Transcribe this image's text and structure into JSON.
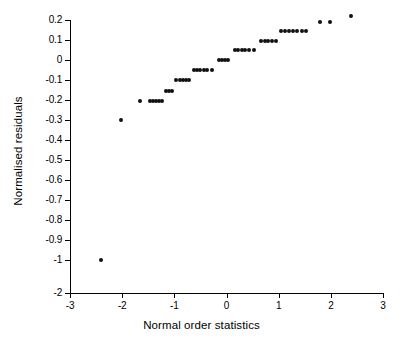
{
  "chart_data": {
    "type": "scatter",
    "title": "",
    "xlabel": "Normal order statistics",
    "ylabel": "Normalised residuals",
    "xlim": [
      -3,
      3
    ],
    "ylim": [
      -2,
      0.25
    ],
    "grid": false,
    "legend": null,
    "xticks": [
      -3,
      -2,
      -1,
      0,
      1,
      2,
      3
    ],
    "xticklabels": [
      "-3",
      "-2",
      "-1",
      "0",
      "1",
      "2",
      "3"
    ],
    "yticks": [
      0.2,
      0.1,
      0,
      -0.1,
      -0.2,
      -0.3,
      -0.4,
      -0.5,
      -0.6,
      -0.7,
      -0.8,
      -0.9,
      -1,
      -2
    ],
    "yticklabels": [
      "0.2",
      "0.1",
      "0",
      "-0.1",
      "-0.2",
      "-0.3",
      "-0.4",
      "-0.5",
      "-0.6",
      "-0.7",
      "-0.8",
      "-0.9",
      "-1",
      "-2"
    ],
    "y_axis_note": "Non-linear axis: uniform spacing from 0.2 down to -1, then a single equal step to -2",
    "marker": "filled-circle",
    "marker_color": "#111111",
    "n_points": 49,
    "points": [
      {
        "x": -2.4,
        "y": -1.0
      },
      {
        "x": -2.02,
        "y": -0.3
      },
      {
        "x": -1.66,
        "y": -0.205
      },
      {
        "x": -1.47,
        "y": -0.205
      },
      {
        "x": -1.41,
        "y": -0.205
      },
      {
        "x": -1.35,
        "y": -0.205
      },
      {
        "x": -1.29,
        "y": -0.205
      },
      {
        "x": -1.23,
        "y": -0.205
      },
      {
        "x": -1.16,
        "y": -0.155
      },
      {
        "x": -1.1,
        "y": -0.155
      },
      {
        "x": -1.04,
        "y": -0.155
      },
      {
        "x": -0.96,
        "y": -0.1
      },
      {
        "x": -0.9,
        "y": -0.1
      },
      {
        "x": -0.84,
        "y": -0.1
      },
      {
        "x": -0.78,
        "y": -0.1
      },
      {
        "x": -0.72,
        "y": -0.1
      },
      {
        "x": -0.62,
        "y": -0.05
      },
      {
        "x": -0.56,
        "y": -0.05
      },
      {
        "x": -0.5,
        "y": -0.05
      },
      {
        "x": -0.44,
        "y": -0.05
      },
      {
        "x": -0.38,
        "y": -0.05
      },
      {
        "x": -0.28,
        "y": -0.05
      },
      {
        "x": -0.15,
        "y": 0.0
      },
      {
        "x": -0.09,
        "y": 0.0
      },
      {
        "x": -0.03,
        "y": 0.0
      },
      {
        "x": 0.03,
        "y": 0.0
      },
      {
        "x": 0.17,
        "y": 0.048
      },
      {
        "x": 0.23,
        "y": 0.048
      },
      {
        "x": 0.29,
        "y": 0.048
      },
      {
        "x": 0.36,
        "y": 0.048
      },
      {
        "x": 0.44,
        "y": 0.048
      },
      {
        "x": 0.52,
        "y": 0.048
      },
      {
        "x": 0.66,
        "y": 0.095
      },
      {
        "x": 0.73,
        "y": 0.095
      },
      {
        "x": 0.8,
        "y": 0.095
      },
      {
        "x": 0.87,
        "y": 0.095
      },
      {
        "x": 0.94,
        "y": 0.095
      },
      {
        "x": 1.04,
        "y": 0.145
      },
      {
        "x": 1.12,
        "y": 0.145
      },
      {
        "x": 1.19,
        "y": 0.145
      },
      {
        "x": 1.27,
        "y": 0.145
      },
      {
        "x": 1.35,
        "y": 0.145
      },
      {
        "x": 1.44,
        "y": 0.145
      },
      {
        "x": 1.53,
        "y": 0.145
      },
      {
        "x": 1.79,
        "y": 0.19
      },
      {
        "x": 1.99,
        "y": 0.19
      },
      {
        "x": 2.38,
        "y": 0.222
      }
    ]
  }
}
